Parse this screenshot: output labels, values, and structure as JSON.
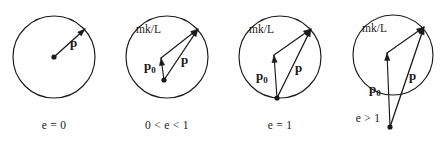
{
  "figure": {
    "stroke_color": "#1a1a1a",
    "background_color": "#ffffff"
  },
  "panels": [
    {
      "id": "panel-e-zero",
      "caption": "e = 0",
      "caption_x": 54,
      "caption_y": 129,
      "circle": {
        "cx": 54,
        "cy": 57,
        "r": 41
      },
      "origin_dot": {
        "x": 54,
        "y": 57,
        "r": 2.6
      },
      "vectors": [
        {
          "name": "p",
          "label": "p",
          "label_x": 70,
          "label_y": 47,
          "x1": 54,
          "y1": 57,
          "x2": 85,
          "y2": 29
        }
      ],
      "has_mkl": false,
      "has_p0": false
    },
    {
      "id": "panel-e-between-zero-and-one",
      "caption": "0 < e < 1",
      "caption_x": 167,
      "caption_y": 129,
      "circle": {
        "cx": 167,
        "cy": 57,
        "r": 41
      },
      "origin_dot": {
        "x": 164,
        "y": 80,
        "r": 2.6
      },
      "vectors": [
        {
          "name": "p",
          "label": "p",
          "label_x": 181,
          "label_y": 64,
          "x1": 164,
          "y1": 80,
          "x2": 198,
          "y2": 29
        },
        {
          "name": "p0",
          "label": "p",
          "sub": "0",
          "label_x": 144,
          "label_y": 70,
          "x1": 164,
          "y1": 80,
          "x2": 161,
          "y2": 58
        },
        {
          "name": "mk-over-L",
          "label": "mk/L",
          "label_x": 136,
          "label_y": 33,
          "x1": 161,
          "y1": 58,
          "x2": 198,
          "y2": 29
        }
      ],
      "has_mkl": true,
      "has_p0": true
    },
    {
      "id": "panel-e-one",
      "caption": "e = 1",
      "caption_x": 280,
      "caption_y": 129,
      "circle": {
        "cx": 280,
        "cy": 57,
        "r": 41
      },
      "origin_dot": {
        "x": 277,
        "y": 98,
        "r": 2.6
      },
      "vectors": [
        {
          "name": "p",
          "label": "p",
          "label_x": 295,
          "label_y": 72,
          "x1": 277,
          "y1": 98,
          "x2": 311,
          "y2": 29
        },
        {
          "name": "p0",
          "label": "p",
          "sub": "0",
          "label_x": 256,
          "label_y": 80,
          "x1": 277,
          "y1": 98,
          "x2": 274,
          "y2": 55
        },
        {
          "name": "mk-over-L",
          "label": "mk/L",
          "label_x": 249,
          "label_y": 33,
          "x1": 274,
          "y1": 55,
          "x2": 311,
          "y2": 29
        }
      ],
      "has_mkl": true,
      "has_p0": true
    },
    {
      "id": "panel-e-greater-than-one",
      "caption": "e > 1",
      "caption_x": 368,
      "caption_y": 122,
      "circle": {
        "cx": 393,
        "cy": 55,
        "r": 40
      },
      "origin_dot": {
        "x": 390,
        "y": 127,
        "r": 2.6
      },
      "vectors": [
        {
          "name": "p",
          "label": "p",
          "label_x": 409,
          "label_y": 80,
          "x1": 390,
          "y1": 127,
          "x2": 424,
          "y2": 27
        },
        {
          "name": "p0",
          "label": "p",
          "sub": "0",
          "label_x": 369,
          "label_y": 93,
          "x1": 390,
          "y1": 127,
          "x2": 387,
          "y2": 53
        },
        {
          "name": "mk-over-L",
          "label": "mk/L",
          "label_x": 362,
          "label_y": 32,
          "x1": 387,
          "y1": 53,
          "x2": 424,
          "y2": 27
        }
      ],
      "has_mkl": true,
      "has_p0": true
    }
  ]
}
